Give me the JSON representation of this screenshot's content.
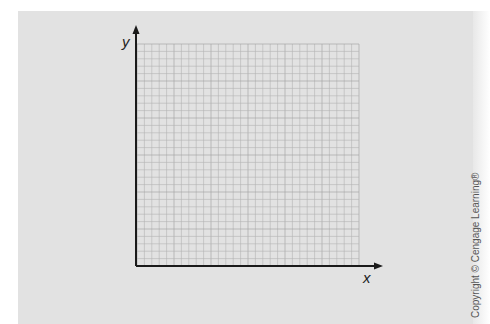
{
  "figure": {
    "type": "blank graph paper with coordinate axes",
    "x_axis_label": "x",
    "y_axis_label": "y",
    "grid": {
      "columns": 30,
      "rows": 30
    },
    "copyright": "Copyright © Cengage Learning®",
    "colors": {
      "background": "#e2e2e2",
      "grid": "#b4b4b4",
      "grid_major": "#a0a0a0",
      "axis": "#1a1a1a"
    }
  }
}
